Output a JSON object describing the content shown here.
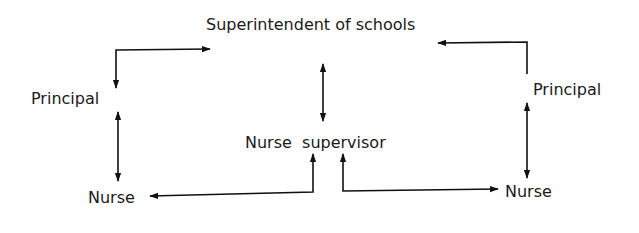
{
  "diagram": {
    "type": "organizational-communication-flow",
    "nodes": {
      "superintendent": {
        "label": "Superintendent of schools"
      },
      "principal_left": {
        "label": "Principal"
      },
      "principal_right": {
        "label": "Principal"
      },
      "nurse_supervisor": {
        "label": "Nurse  supervisor"
      },
      "nurse_left": {
        "label": "Nurse"
      },
      "nurse_right": {
        "label": "Nurse"
      }
    },
    "edges": [
      {
        "from": "principal_left",
        "to": "superintendent",
        "style": "elbow",
        "direction": "both"
      },
      {
        "from": "principal_right",
        "to": "superintendent",
        "style": "elbow",
        "direction": "to"
      },
      {
        "from": "superintendent",
        "to": "nurse_supervisor",
        "style": "straight",
        "direction": "both"
      },
      {
        "from": "principal_left",
        "to": "nurse_left",
        "style": "straight",
        "direction": "both"
      },
      {
        "from": "principal_right",
        "to": "nurse_right",
        "style": "straight",
        "direction": "both"
      },
      {
        "from": "nurse_left",
        "to": "nurse_supervisor",
        "style": "elbow",
        "direction": "both"
      },
      {
        "from": "nurse_supervisor",
        "to": "nurse_right",
        "style": "elbow",
        "direction": "both"
      }
    ],
    "colors": {
      "line": "#111111",
      "text": "#1a1a1a",
      "background": "#ffffff"
    }
  }
}
